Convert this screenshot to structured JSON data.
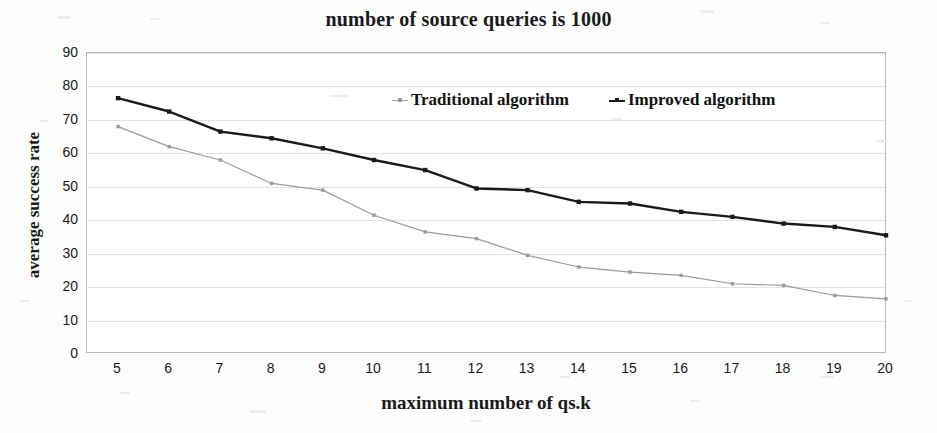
{
  "chart_data": {
    "type": "line",
    "title": "number of source queries is 1000",
    "xlabel": "maximum number of qs.k",
    "ylabel": "average success rate",
    "x": [
      5,
      6,
      7,
      8,
      9,
      10,
      11,
      12,
      13,
      14,
      15,
      16,
      17,
      18,
      19,
      20
    ],
    "categories": [
      "5",
      "6",
      "7",
      "8",
      "9",
      "10",
      "11",
      "12",
      "13",
      "14",
      "15",
      "16",
      "17",
      "18",
      "19",
      "20"
    ],
    "series": [
      {
        "name": "Traditional algorithm",
        "color": "#9a9a9a",
        "marker": "square",
        "values": [
          68,
          62,
          58,
          51,
          49,
          41.5,
          36.5,
          34.5,
          29.5,
          26,
          24.5,
          23.5,
          21,
          20.5,
          17.5,
          16.5
        ]
      },
      {
        "name": "Improved algorithm",
        "color": "#1a1a1a",
        "marker": "square",
        "values": [
          76.5,
          72.5,
          66.5,
          64.5,
          61.5,
          58,
          55,
          49.5,
          49,
          45.5,
          45,
          42.5,
          41,
          39,
          38,
          35.5
        ]
      }
    ],
    "ylim": [
      0,
      90
    ],
    "yticks": [
      0,
      10,
      20,
      30,
      40,
      50,
      60,
      70,
      80,
      90
    ],
    "ytick_labels": [
      "0",
      "10",
      "20",
      "30",
      "40",
      "50",
      "60",
      "70",
      "80",
      "90"
    ],
    "xlim": [
      5,
      20
    ],
    "grid": "horizontal",
    "legend_position": "top-center-inside",
    "plot_background": "#ffffff",
    "grid_color": "#e2e2e2",
    "axis_color": "#b9b9b9"
  }
}
